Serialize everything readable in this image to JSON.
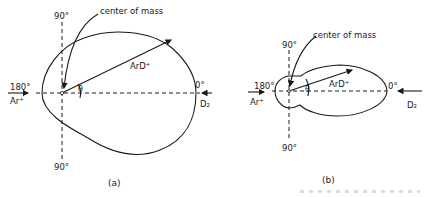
{
  "panel_a": {
    "label": "(a)",
    "top_angle": "90°",
    "bottom_angle": "90°",
    "left_angle": "180°",
    "right_angle": "0°",
    "center_label": "center of mass",
    "vector_label": "ArD⁺",
    "angle_symbol": "θ",
    "left_beam": "Ar⁺",
    "right_beam": "D₂"
  },
  "panel_b": {
    "label": "(b)",
    "top_angle": "90°",
    "bottom_angle": "90°",
    "left_angle": "180°",
    "right_angle": "0°",
    "center_label": "center of mass",
    "vector_label": "ArD⁺",
    "angle_symbol": "θ",
    "left_beam": "Ar⁺",
    "right_beam": "D₂"
  }
}
